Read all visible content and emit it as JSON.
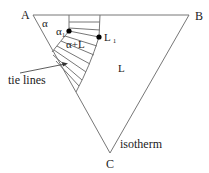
{
  "diagram": {
    "type": "ternary isothermal section",
    "vertices": {
      "A": {
        "label": "A",
        "x": 33,
        "y": 15
      },
      "B": {
        "label": "B",
        "x": 189,
        "y": 15
      },
      "C": {
        "label": "C",
        "x": 110,
        "y": 153
      }
    },
    "regions": {
      "alpha": "α",
      "alpha_plus_L": "α+L",
      "L": "L"
    },
    "points": {
      "alpha1": {
        "label": "α",
        "subscript": "1",
        "x": 69,
        "y": 31
      },
      "L1": {
        "label": "L",
        "subscript": "1",
        "x": 99,
        "y": 37
      }
    },
    "annotations": {
      "tie_lines": "tie lines",
      "isotherm": "isotherm"
    },
    "colors": {
      "line": "#777777",
      "text": "#1a1a1a",
      "dot": "#000000"
    }
  }
}
